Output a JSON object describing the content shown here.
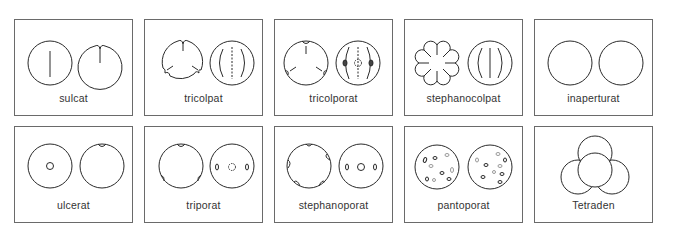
{
  "diagram": {
    "panels": [
      {
        "id": "sulcat",
        "label": "sulcat",
        "row": 0,
        "col": 0
      },
      {
        "id": "tricolpat",
        "label": "tricolpat",
        "row": 0,
        "col": 1
      },
      {
        "id": "tricolporat",
        "label": "tricolporat",
        "row": 0,
        "col": 2
      },
      {
        "id": "stephanocolpat",
        "label": "stephanocolpat",
        "row": 0,
        "col": 3
      },
      {
        "id": "inaperturat",
        "label": "inaperturat",
        "row": 0,
        "col": 4
      },
      {
        "id": "ulcerat",
        "label": "ulcerat",
        "row": 1,
        "col": 0
      },
      {
        "id": "triporat",
        "label": "triporat",
        "row": 1,
        "col": 1
      },
      {
        "id": "stephanoporat",
        "label": "stephanoporat",
        "row": 1,
        "col": 2
      },
      {
        "id": "pantoporat",
        "label": "pantoporat",
        "row": 1,
        "col": 3
      },
      {
        "id": "tetraden",
        "label": "Tetraden",
        "row": 1,
        "col": 4
      }
    ],
    "colors": {
      "stroke": "#2a2a2a",
      "border": "#6a6a6a",
      "text": "#333333"
    }
  }
}
